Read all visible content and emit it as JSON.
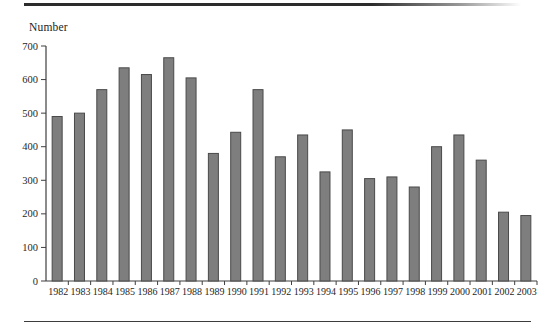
{
  "page": {
    "background": "#ffffff"
  },
  "chart_data": {
    "type": "bar",
    "title": "",
    "ylabel": "Number",
    "xlabel": "",
    "categories": [
      "1982",
      "1983",
      "1984",
      "1985",
      "1986",
      "1987",
      "1988",
      "1989",
      "1990",
      "1991",
      "1992",
      "1993",
      "1994",
      "1995",
      "1996",
      "1997",
      "1998",
      "1999",
      "2000",
      "2001",
      "2002",
      "2003"
    ],
    "values": [
      490,
      500,
      570,
      635,
      615,
      665,
      605,
      380,
      443,
      570,
      370,
      435,
      325,
      450,
      305,
      310,
      280,
      400,
      435,
      360,
      205,
      195
    ],
    "ylim": [
      0,
      700
    ],
    "yticks": [
      0,
      100,
      200,
      300,
      400,
      500,
      600,
      700
    ],
    "grid": false,
    "legend": "none",
    "colors": {
      "bar_fill": "#7e7e7e",
      "bar_stroke": "#4a4a4a",
      "axis": "#3f3f3f",
      "text": "#1f1f1f",
      "rule": "#2c2c2c"
    }
  }
}
